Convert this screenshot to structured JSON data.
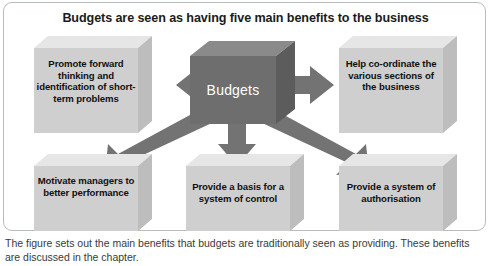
{
  "figure": {
    "title": "Budgets are seen as having five main benefits to the business",
    "center_node": {
      "label": "Budgets",
      "fill_color": "#6e6e6e",
      "text_color": "#ffffff"
    },
    "box_fill_color": "#cfcfcf",
    "box_top_color": "#e6e6e6",
    "box_side_color": "#bdbdbd",
    "arrow_color": "#737373",
    "nodes": [
      {
        "id": "promote-forward-thinking",
        "label": "Promote forward thinking and identification of short-term problems",
        "position": "top-left"
      },
      {
        "id": "help-co-ordinate",
        "label": "Help co-ordinate the various sections of the business",
        "position": "top-right"
      },
      {
        "id": "motivate-managers",
        "label": "Motivate managers to better performance",
        "position": "bottom-left"
      },
      {
        "id": "provide-basis-control",
        "label": "Provide a basis for a system of control",
        "position": "bottom-center"
      },
      {
        "id": "provide-system-authorisation",
        "label": "Provide a system of authorisation",
        "position": "bottom-right"
      }
    ],
    "arrows": [
      {
        "id": "arrow-left",
        "from": "budgets",
        "to": "promote-forward-thinking",
        "direction": "left"
      },
      {
        "id": "arrow-right",
        "from": "budgets",
        "to": "help-co-ordinate",
        "direction": "right"
      },
      {
        "id": "arrow-down-left",
        "from": "budgets",
        "to": "motivate-managers",
        "direction": "down-left"
      },
      {
        "id": "arrow-down",
        "from": "budgets",
        "to": "provide-basis-control",
        "direction": "down"
      },
      {
        "id": "arrow-down-right",
        "from": "budgets",
        "to": "provide-system-authorisation",
        "direction": "down-right"
      }
    ]
  },
  "caption": {
    "text": "The figure sets out the main benefits that budgets are traditionally seen as providing. These benefits are discussed in the chapter."
  }
}
